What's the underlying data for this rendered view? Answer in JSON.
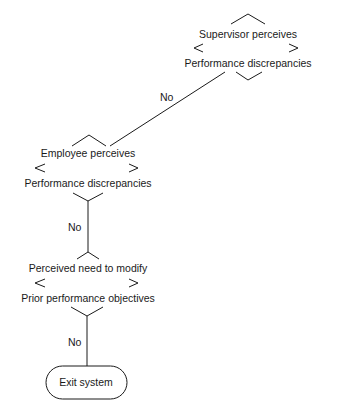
{
  "diagram": {
    "type": "flowchart",
    "nodes": [
      {
        "id": "d1",
        "shape": "decision",
        "line1": "Supervisor perceives",
        "line2": "Performance discrepancies"
      },
      {
        "id": "d2",
        "shape": "decision",
        "line1": "Employee perceives",
        "line2": "Performance discrepancies"
      },
      {
        "id": "d3",
        "shape": "decision",
        "line1": "Perceived need to modify",
        "line2": "Prior performance objectives"
      },
      {
        "id": "exit",
        "shape": "terminal",
        "label": "Exit system"
      }
    ],
    "edges": [
      {
        "from": "d1",
        "to": "d2",
        "label": "No"
      },
      {
        "from": "d2",
        "to": "d3",
        "label": "No"
      },
      {
        "from": "d3",
        "to": "exit",
        "label": "No"
      }
    ]
  }
}
